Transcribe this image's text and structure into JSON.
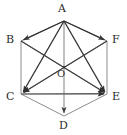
{
  "figure": {
    "name": "regular-hexagon-vector-diagram",
    "width": 127,
    "height": 135,
    "background_color": "#ffffff"
  },
  "colors": {
    "vector_stroke": "#2f2f2f",
    "edge_stroke": "#8c8c8c",
    "diagonal_stroke": "#8c8c8c",
    "label_text": "#2b2b2b",
    "center_label_text": "#3a3a3a"
  },
  "vertices": [
    {
      "id": "A",
      "label": "A",
      "x": 64,
      "y": 21,
      "label_x": 58,
      "label_y": 3
    },
    {
      "id": "B",
      "label": "B",
      "x": 21,
      "y": 41,
      "label_x": 6,
      "label_y": 34
    },
    {
      "id": "C",
      "label": "C",
      "x": 21,
      "y": 94,
      "label_x": 6,
      "label_y": 91
    },
    {
      "id": "D",
      "label": "D",
      "x": 64,
      "y": 116,
      "label_x": 59,
      "label_y": 120
    },
    {
      "id": "E",
      "label": "E",
      "x": 107,
      "y": 94,
      "label_x": 112,
      "label_y": 91
    },
    {
      "id": "F",
      "label": "F",
      "x": 107,
      "y": 41,
      "label_x": 112,
      "label_y": 34
    }
  ],
  "center": {
    "id": "O",
    "label": "O",
    "x": 64,
    "y": 67,
    "label_x": 57,
    "label_y": 69
  },
  "edges": [
    {
      "name": "edge-AB",
      "from": "A",
      "to": "B",
      "style": "edge"
    },
    {
      "name": "edge-BC",
      "from": "B",
      "to": "C",
      "style": "edge"
    },
    {
      "name": "edge-CD",
      "from": "C",
      "to": "D",
      "style": "edge"
    },
    {
      "name": "edge-DE",
      "from": "D",
      "to": "E",
      "style": "edge"
    },
    {
      "name": "edge-EF",
      "from": "E",
      "to": "F",
      "style": "edge"
    },
    {
      "name": "edge-FA",
      "from": "F",
      "to": "A",
      "style": "edge"
    }
  ],
  "diagonals": [
    {
      "name": "diagonal-BE",
      "from": "B",
      "to": "E",
      "style": "diagonal",
      "arrow": true
    },
    {
      "name": "diagonal-FC",
      "from": "F",
      "to": "C",
      "style": "diagonal",
      "arrow": true
    },
    {
      "name": "diagonal-CE",
      "from": "C",
      "to": "E",
      "style": "diagonal",
      "arrow": true
    },
    {
      "name": "diagonal-AD",
      "from": "A",
      "to": "D",
      "style": "diagonal",
      "arrow": true
    }
  ],
  "vectors": [
    {
      "name": "vector-AB",
      "from": "A",
      "to": "B",
      "arrow": true
    },
    {
      "name": "vector-AC",
      "from": "A",
      "to": "C",
      "arrow": true
    },
    {
      "name": "vector-AE",
      "from": "A",
      "to": "E",
      "arrow": true
    },
    {
      "name": "vector-AF",
      "from": "A",
      "to": "F",
      "arrow": true
    },
    {
      "name": "vector-CE-bold",
      "from": "C",
      "to": "E",
      "arrow": true
    }
  ],
  "labels": {
    "A": "A",
    "B": "B",
    "C": "C",
    "D": "D",
    "E": "E",
    "F": "F",
    "O": "O"
  }
}
